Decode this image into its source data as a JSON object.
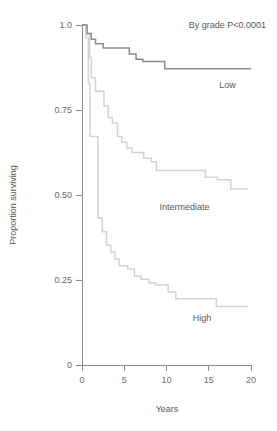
{
  "chart_data": {
    "type": "line",
    "subtype": "kaplan-meier-step",
    "title": "",
    "annotation": "By grade P<0.0001",
    "xlabel": "Years",
    "ylabel": "Proportion surviving",
    "xlim": [
      0,
      20
    ],
    "ylim": [
      0,
      1.0
    ],
    "xticks": [
      0,
      5,
      10,
      15,
      20
    ],
    "xtick_labels": [
      "0",
      "5",
      "10",
      "15",
      "20"
    ],
    "yticks": [
      0,
      0.25,
      0.5,
      0.75,
      1.0
    ],
    "ytick_labels": [
      "0",
      "0.25",
      "0.50",
      "0.75",
      "1.0"
    ],
    "grid": false,
    "legend_position": "inline-right-of-curve",
    "series": [
      {
        "name": "Low",
        "label": "Low",
        "color": "#8d8d8f",
        "width": 1.5,
        "label_x": 18.2,
        "label_y": 0.815,
        "points": [
          [
            0.0,
            1.0
          ],
          [
            0.6,
            1.0
          ],
          [
            0.6,
            0.975
          ],
          [
            1.1,
            0.975
          ],
          [
            1.1,
            0.958
          ],
          [
            1.6,
            0.958
          ],
          [
            1.6,
            0.945
          ],
          [
            2.5,
            0.945
          ],
          [
            2.5,
            0.932
          ],
          [
            5.6,
            0.932
          ],
          [
            5.6,
            0.915
          ],
          [
            6.4,
            0.915
          ],
          [
            6.4,
            0.899
          ],
          [
            7.2,
            0.899
          ],
          [
            7.2,
            0.893
          ],
          [
            9.8,
            0.893
          ],
          [
            9.8,
            0.871
          ],
          [
            20.0,
            0.871
          ]
        ]
      },
      {
        "name": "Intermediate",
        "label": "Intermediate",
        "color": "#d3d3d5",
        "width": 1.5,
        "label_x": 15.1,
        "label_y": 0.455,
        "points": [
          [
            0.0,
            1.0
          ],
          [
            0.5,
            1.0
          ],
          [
            0.5,
            0.972
          ],
          [
            0.9,
            0.972
          ],
          [
            0.9,
            0.905
          ],
          [
            1.1,
            0.905
          ],
          [
            1.1,
            0.845
          ],
          [
            1.6,
            0.845
          ],
          [
            1.6,
            0.805
          ],
          [
            2.6,
            0.805
          ],
          [
            2.6,
            0.762
          ],
          [
            3.1,
            0.762
          ],
          [
            3.1,
            0.728
          ],
          [
            3.6,
            0.728
          ],
          [
            3.6,
            0.712
          ],
          [
            4.2,
            0.712
          ],
          [
            4.2,
            0.672
          ],
          [
            4.7,
            0.672
          ],
          [
            4.7,
            0.655
          ],
          [
            5.3,
            0.655
          ],
          [
            5.3,
            0.638
          ],
          [
            5.9,
            0.638
          ],
          [
            5.9,
            0.625
          ],
          [
            7.3,
            0.625
          ],
          [
            7.3,
            0.608
          ],
          [
            8.2,
            0.608
          ],
          [
            8.2,
            0.598
          ],
          [
            8.8,
            0.598
          ],
          [
            8.8,
            0.572
          ],
          [
            14.6,
            0.572
          ],
          [
            14.6,
            0.552
          ],
          [
            16.0,
            0.552
          ],
          [
            16.0,
            0.545
          ],
          [
            17.6,
            0.545
          ],
          [
            17.6,
            0.518
          ],
          [
            19.6,
            0.518
          ]
        ]
      },
      {
        "name": "High",
        "label": "High",
        "color": "#d3d3d5",
        "width": 1.5,
        "label_x": 15.3,
        "label_y": 0.128,
        "points": [
          [
            0.0,
            1.0
          ],
          [
            0.45,
            1.0
          ],
          [
            0.45,
            0.962
          ],
          [
            0.75,
            0.962
          ],
          [
            0.75,
            0.828
          ],
          [
            0.95,
            0.828
          ],
          [
            0.95,
            0.672
          ],
          [
            1.9,
            0.672
          ],
          [
            1.9,
            0.432
          ],
          [
            2.4,
            0.432
          ],
          [
            2.4,
            0.392
          ],
          [
            2.9,
            0.392
          ],
          [
            2.9,
            0.352
          ],
          [
            3.4,
            0.352
          ],
          [
            3.4,
            0.332
          ],
          [
            3.9,
            0.332
          ],
          [
            3.9,
            0.312
          ],
          [
            4.4,
            0.312
          ],
          [
            4.4,
            0.292
          ],
          [
            5.4,
            0.292
          ],
          [
            5.4,
            0.282
          ],
          [
            6.2,
            0.282
          ],
          [
            6.2,
            0.262
          ],
          [
            7.0,
            0.262
          ],
          [
            7.0,
            0.252
          ],
          [
            7.9,
            0.252
          ],
          [
            7.9,
            0.242
          ],
          [
            8.7,
            0.242
          ],
          [
            8.7,
            0.235
          ],
          [
            10.2,
            0.235
          ],
          [
            10.2,
            0.215
          ],
          [
            11.1,
            0.215
          ],
          [
            11.1,
            0.195
          ],
          [
            15.9,
            0.195
          ],
          [
            15.9,
            0.172
          ],
          [
            19.6,
            0.172
          ]
        ]
      }
    ]
  }
}
